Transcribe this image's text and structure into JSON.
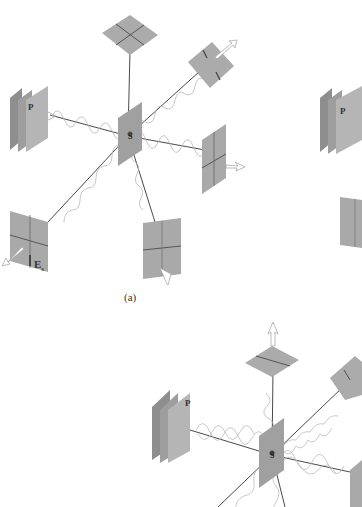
{
  "figure": {
    "panels": [
      {
        "id": "a",
        "caption": "(a)",
        "source_label": "S",
        "polarizer_label": "P",
        "field_label": "E",
        "field_subscript": "s"
      },
      {
        "id": "b",
        "caption": "",
        "source_label": "S",
        "polarizer_label": "P"
      },
      {
        "id": "c",
        "caption": "",
        "source_label": "S",
        "polarizer_label": "P"
      }
    ]
  },
  "colors": {
    "plate": "#a9a9a9",
    "plate_dark": "#8e8e8e",
    "plate_light": "#c2c2c2",
    "axis_line": "#333333",
    "wave": "#b5b5b5",
    "arrow": "#bdbdbd",
    "text": "#333333"
  }
}
